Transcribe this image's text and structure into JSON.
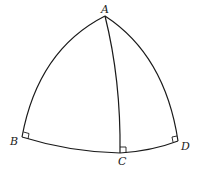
{
  "diagram": {
    "type": "spherical-triangle",
    "points": {
      "A": {
        "label": "A"
      },
      "B": {
        "label": "B"
      },
      "C": {
        "label": "C"
      },
      "D": {
        "label": "D"
      }
    },
    "arcs": [
      "AB",
      "AC",
      "AD",
      "BC",
      "CD"
    ],
    "right_angle_markers": [
      "B",
      "C",
      "D"
    ]
  }
}
